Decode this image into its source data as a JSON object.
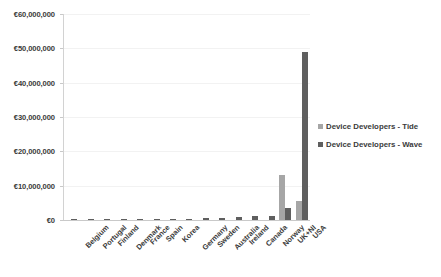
{
  "chart_data": {
    "type": "bar",
    "title": "",
    "subtitle": "",
    "xlabel": "",
    "ylabel": "",
    "ylim": [
      0,
      60000000
    ],
    "ytick_values": [
      0,
      10000000,
      20000000,
      30000000,
      40000000,
      50000000,
      60000000
    ],
    "ytick_labels": [
      "€0",
      "€10,000,000",
      "€20,000,000",
      "€30,000,000",
      "€40,000,000",
      "€50,000,000",
      "€60,000,000"
    ],
    "grid": true,
    "legend_position": "right",
    "categories": [
      "Belgium",
      "Portugal",
      "Finland",
      "Denmark",
      "France",
      "Spain",
      "Korea",
      "Germany",
      "Sweden",
      "Australia",
      "Ireland",
      "Canada",
      "Norway",
      "UK+NI",
      "USA"
    ],
    "series": [
      {
        "name": "Device Developers - Tide",
        "color": "#a6a6a6",
        "values": [
          0,
          0,
          0,
          0,
          0,
          0,
          0,
          0,
          0,
          0,
          0,
          0,
          0,
          13000000,
          5500000
        ]
      },
      {
        "name": "Device Developers - Wave",
        "color": "#5f5f5f",
        "values": [
          60000,
          80000,
          120000,
          150000,
          200000,
          250000,
          300000,
          400000,
          500000,
          700000,
          800000,
          1100000,
          1200000,
          3500000,
          49000000
        ]
      }
    ]
  },
  "legend": {
    "items": [
      {
        "label": "Device Developers - Tide",
        "swatch": "tide"
      },
      {
        "label": "Device Developers - Wave",
        "swatch": "wave"
      }
    ]
  }
}
